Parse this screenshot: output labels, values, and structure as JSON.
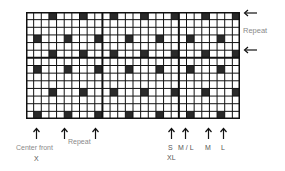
{
  "chart_data": {
    "type": "heatmap",
    "title": "",
    "grid": {
      "columns": 28,
      "rows": 14,
      "cell_px": 7.64,
      "thick_vertical_lines_after_col": [
        10,
        20
      ],
      "thick_horizontal_lines_after_row": [
        6
      ]
    },
    "filled_cells": [
      {
        "row": 0,
        "cols": [
          3,
          7,
          11,
          15,
          19,
          23,
          27
        ]
      },
      {
        "row": 3,
        "cols": [
          1,
          5,
          9,
          13,
          17,
          21,
          25
        ]
      },
      {
        "row": 5,
        "cols": [
          3,
          7,
          11,
          15,
          19,
          23,
          27
        ]
      },
      {
        "row": 7,
        "cols": [
          1,
          5,
          9,
          13,
          17,
          21,
          25
        ]
      },
      {
        "row": 10,
        "cols": [
          3,
          7,
          11,
          15,
          19,
          23,
          27
        ]
      },
      {
        "row": 13,
        "cols": [
          1,
          5,
          9,
          13,
          17,
          21,
          25
        ]
      }
    ],
    "colors": {
      "filled": "#2a2a2a",
      "empty": "#ffffff",
      "line": "#111111"
    }
  },
  "right_annotations": {
    "arrows_y": [
      13,
      50
    ],
    "label": "Repeat"
  },
  "bottom_annotations": [
    {
      "x": 36,
      "label": "Center front",
      "sublabel": "X"
    },
    {
      "x": 64,
      "label": "",
      "sublabel": ""
    },
    {
      "x": 95,
      "label": "",
      "sublabel": ""
    },
    {
      "x": 171,
      "label": "S",
      "sublabel": "XL"
    },
    {
      "x": 185,
      "label": "M / L",
      "sublabel": ""
    },
    {
      "x": 208,
      "label": "M",
      "sublabel": ""
    },
    {
      "x": 223,
      "label": "L",
      "sublabel": ""
    }
  ],
  "labels": {
    "center_front": "Center front",
    "center_front_sub": "X",
    "repeat_bottom": "Repeat",
    "repeat_right": "Repeat",
    "size_s": "S",
    "size_xl": "XL",
    "size_ml": "M / L",
    "size_m": "M",
    "size_l": "L"
  }
}
